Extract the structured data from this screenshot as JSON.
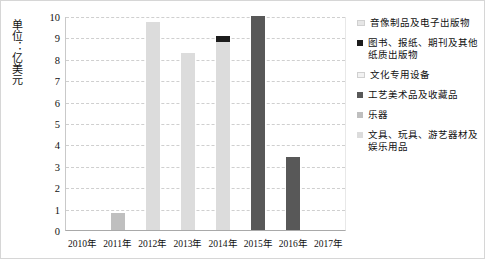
{
  "chart_data": {
    "type": "bar",
    "title": "",
    "subtitle": "",
    "xlabel": "",
    "ylabel": "单位：亿美元",
    "ylim": [
      0,
      10
    ],
    "ytick_labels": [
      "10",
      "9",
      "8",
      "7",
      "6",
      "5",
      "4",
      "3",
      "2",
      "1",
      "0"
    ],
    "grid": true,
    "legend_position": "right",
    "categories": [
      "2010年",
      "2011年",
      "2012年",
      "2013年",
      "2014年",
      "2015年",
      "2016年",
      "2017年"
    ],
    "series": [
      {
        "name": "音像制品及电子出版物",
        "color": "#e6e6e6",
        "values": [
          0,
          0,
          0,
          0,
          0,
          0,
          0,
          0
        ]
      },
      {
        "name": "图书、报纸、期刊及其他纸质出版物",
        "color": "#1c1c1c",
        "values": [
          0,
          0,
          0,
          0,
          0.27,
          0,
          0,
          0
        ]
      },
      {
        "name": "文化专用设备",
        "color": "#f2f2f2",
        "values": [
          0,
          0,
          0,
          0,
          0,
          0,
          0,
          0
        ]
      },
      {
        "name": "工艺美术品及收藏品",
        "color": "#585858",
        "values": [
          0,
          0,
          0,
          0,
          0,
          10.0,
          3.42,
          0
        ]
      },
      {
        "name": "乐器",
        "color": "#bfbfbf",
        "values": [
          0,
          0.8,
          0,
          0,
          0,
          0,
          0,
          0
        ]
      },
      {
        "name": "文具、玩具、游艺器材及娱乐用品",
        "color": "#dcdcdc",
        "values": [
          0,
          0,
          9.7,
          8.26,
          8.8,
          0,
          0,
          0
        ]
      }
    ],
    "bar_totals": [
      0,
      0.8,
      9.7,
      8.26,
      9.07,
      10.0,
      3.42,
      0
    ],
    "bars": [
      {
        "category": "2010年",
        "segments": []
      },
      {
        "category": "2011年",
        "segments": [
          {
            "value": 0.8,
            "color": "#bfbfbf",
            "series": "乐器"
          }
        ]
      },
      {
        "category": "2012年",
        "segments": [
          {
            "value": 9.7,
            "color": "#dcdcdc",
            "series": "文具、玩具、游艺器材及娱乐用品"
          }
        ]
      },
      {
        "category": "2013年",
        "segments": [
          {
            "value": 8.26,
            "color": "#dcdcdc",
            "series": "文具、玩具、游艺器材及娱乐用品"
          }
        ]
      },
      {
        "category": "2014年",
        "segments": [
          {
            "value": 8.8,
            "color": "#dcdcdc",
            "series": "文具、玩具、游艺器材及娱乐用品"
          },
          {
            "value": 0.27,
            "color": "#1c1c1c",
            "series": "图书、报纸、期刊及其他纸质出版物"
          }
        ]
      },
      {
        "category": "2015年",
        "segments": [
          {
            "value": 10.0,
            "color": "#585858",
            "series": "工艺美术品及收藏品"
          }
        ]
      },
      {
        "category": "2016年",
        "segments": [
          {
            "value": 3.42,
            "color": "#585858",
            "series": "工艺美术品及收藏品"
          }
        ]
      },
      {
        "category": "2017年",
        "segments": []
      }
    ]
  },
  "legend": {
    "items": [
      {
        "label": "音像制品及电子出版物",
        "color": "#e6e6e6"
      },
      {
        "label": "图书、报纸、期刊及其他纸质出版物",
        "color": "#1c1c1c"
      },
      {
        "label": "文化专用设备",
        "color": "#f2f2f2"
      },
      {
        "label": "工艺美术品及收藏品",
        "color": "#585858"
      },
      {
        "label": "乐器",
        "color": "#bfbfbf"
      },
      {
        "label": "文具、玩具、游艺器材及娱乐用品",
        "color": "#dcdcdc"
      }
    ]
  }
}
